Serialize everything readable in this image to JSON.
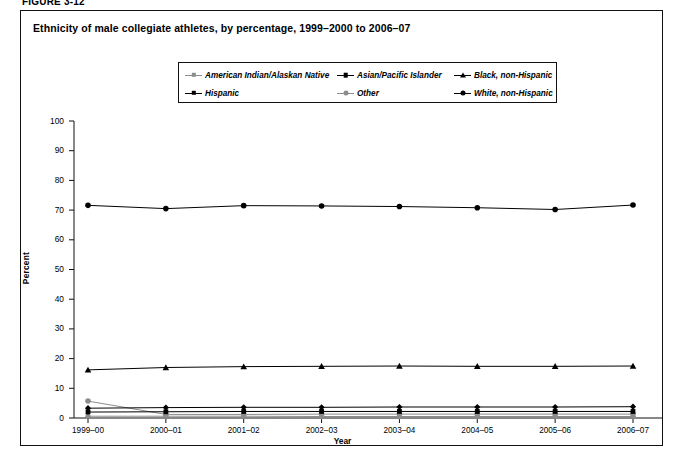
{
  "figure_label": "FIGURE 3-12",
  "figure": {
    "title": "Ethnicity of male collegiate athletes, by percentage, 1999–2000 to 2006–07"
  },
  "legend": {
    "position": "top-center-inside",
    "items": [
      {
        "label": "American Indian/Alaskan Native",
        "marker": "diamond-marker",
        "color": "#8c8c8c"
      },
      {
        "label": "Asian/Pacific Islander",
        "marker": "square-marker",
        "color": "#000000"
      },
      {
        "label": "Black, non-Hispanic",
        "marker": "triangle-marker",
        "color": "#000000"
      },
      {
        "label": "Hispanic",
        "marker": "diamond-marker",
        "color": "#000000"
      },
      {
        "label": "Other",
        "marker": "circle-marker",
        "color": "#8c8c8c"
      },
      {
        "label": "White, non-Hispanic",
        "marker": "circle-marker",
        "color": "#000000"
      }
    ]
  },
  "chart_data": {
    "type": "line",
    "title": "Ethnicity of male collegiate athletes, by percentage, 1999–2000 to 2006–07",
    "xlabel": "Year",
    "ylabel": "Percent",
    "categories": [
      "1999–00",
      "2000–01",
      "2001–02",
      "2002–03",
      "2003–04",
      "2004–05",
      "2005–06",
      "2006–07"
    ],
    "ylim": [
      0,
      100
    ],
    "yticks": [
      0,
      10,
      20,
      30,
      40,
      50,
      60,
      70,
      80,
      90,
      100
    ],
    "grid": false,
    "legend_position": "top-center",
    "series": [
      {
        "name": "American Indian/Alaskan Native",
        "marker": "diamond-marker",
        "color": "#8c8c8c",
        "values": [
          0.6,
          0.6,
          0.6,
          0.5,
          0.5,
          0.5,
          0.5,
          0.5
        ]
      },
      {
        "name": "Asian/Pacific Islander",
        "marker": "square-marker",
        "color": "#000000",
        "values": [
          2.0,
          2.1,
          2.2,
          2.2,
          2.2,
          2.2,
          2.2,
          2.2
        ]
      },
      {
        "name": "Black, non-Hispanic",
        "marker": "triangle-marker",
        "color": "#000000",
        "values": [
          16.2,
          17.0,
          17.3,
          17.4,
          17.5,
          17.4,
          17.4,
          17.5
        ]
      },
      {
        "name": "Hispanic",
        "marker": "diamond-marker",
        "color": "#000000",
        "values": [
          3.3,
          3.5,
          3.6,
          3.6,
          3.7,
          3.7,
          3.7,
          3.8
        ]
      },
      {
        "name": "Other",
        "marker": "circle-marker",
        "color": "#8c8c8c",
        "values": [
          5.7,
          1.2,
          1.2,
          1.3,
          1.3,
          1.3,
          1.3,
          1.3
        ]
      },
      {
        "name": "White, non-Hispanic",
        "marker": "circle-marker",
        "color": "#000000",
        "values": [
          71.6,
          70.5,
          71.5,
          71.4,
          71.2,
          70.8,
          70.2,
          71.7
        ]
      }
    ]
  }
}
